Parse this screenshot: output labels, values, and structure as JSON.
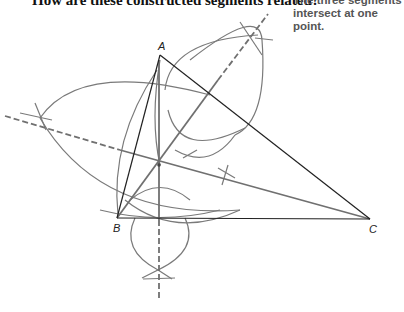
{
  "question": {
    "text": "How are these constructed segments related?"
  },
  "answer": {
    "line1": "The three segments",
    "line2": "intersect at one point."
  },
  "figure": {
    "vertices": {
      "A": "A",
      "B": "B",
      "C": "C"
    },
    "colors": {
      "triangle": "#222222",
      "construction": "#777777",
      "dashed": "#666666"
    }
  }
}
